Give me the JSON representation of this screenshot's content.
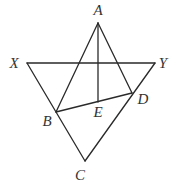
{
  "diagram": {
    "type": "geometry",
    "points": {
      "A": {
        "label": "A",
        "x": 98,
        "y": 23,
        "label_x": 98,
        "label_y": 15
      },
      "X": {
        "label": "X",
        "x": 27,
        "y": 63,
        "label_x": 14,
        "label_y": 68
      },
      "Y": {
        "label": "Y",
        "x": 155,
        "y": 63,
        "label_x": 163,
        "label_y": 68
      },
      "B": {
        "label": "B",
        "x": 56,
        "y": 112,
        "label_x": 47,
        "label_y": 126
      },
      "D": {
        "label": "D",
        "x": 132,
        "y": 93,
        "label_x": 143,
        "label_y": 104
      },
      "E": {
        "label": "E",
        "x": 98,
        "y": 102,
        "label_x": 98,
        "label_y": 117
      },
      "C": {
        "label": "C",
        "x": 85,
        "y": 161,
        "label_x": 80,
        "label_y": 180
      }
    },
    "segments": [
      {
        "from": "X",
        "to": "Y"
      },
      {
        "from": "X",
        "to": "C"
      },
      {
        "from": "Y",
        "to": "C"
      },
      {
        "from": "A",
        "to": "B"
      },
      {
        "from": "A",
        "to": "D"
      },
      {
        "from": "B",
        "to": "D"
      },
      {
        "from": "A",
        "to": "E"
      }
    ]
  }
}
